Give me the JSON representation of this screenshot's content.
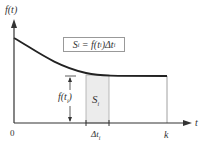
{
  "diagram": {
    "y_axis_label": "f(t)",
    "x_axis_label": "t",
    "origin_label": "0",
    "k_label": "k",
    "formula": "Si = f(ti)Δti",
    "formula_parts": {
      "s": "S",
      "s_sub": "i",
      "eq": " = f(t",
      "t_sub": "i",
      "rest": ")Δt",
      "dt_sub": "i"
    },
    "height_label": {
      "main": "f(t",
      "sub": "i",
      "close": ")"
    },
    "strip_label": {
      "main": "S",
      "sub": "i"
    },
    "width_label": {
      "main": "Δt",
      "sub": "i"
    },
    "colors": {
      "axis": "#333333",
      "curve": "#222222",
      "strip_fill": "#ececec",
      "strip_border": "#aaaaaa",
      "box_border": "#999999"
    }
  }
}
